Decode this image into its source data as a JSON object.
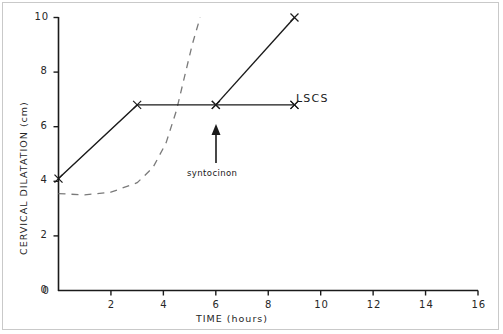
{
  "figure": {
    "background": "#ffffff",
    "border_color": "#c9c9c9"
  },
  "chart_data": {
    "type": "line",
    "title": "",
    "xlabel": "TIME  (hours)",
    "ylabel": "CERVICAL DILATATION (cm)",
    "xlim": [
      0,
      16
    ],
    "ylim": [
      0,
      10
    ],
    "xticks": [
      0,
      2,
      4,
      6,
      8,
      10,
      12,
      14,
      16
    ],
    "xticklabels": [
      "0",
      "2",
      "4",
      "6",
      "8",
      "10",
      "12",
      "14",
      "16"
    ],
    "yticks": [
      0,
      2,
      4,
      6,
      8,
      10
    ],
    "yticklabels": [
      "0",
      "2",
      "4",
      "6",
      "8",
      "10"
    ],
    "grid": false,
    "legend_position": "none",
    "series": [
      {
        "name": "observed labour progress",
        "style": "solid",
        "color": "#1a1a1a",
        "marker": "x",
        "x": [
          0,
          3,
          6,
          9
        ],
        "y": [
          4.1,
          6.8,
          6.8,
          6.8
        ]
      },
      {
        "name": "caesarean section progress",
        "style": "solid",
        "color": "#1a1a1a",
        "marker": "x",
        "x": [
          6,
          9
        ],
        "y": [
          6.8,
          10.0
        ]
      },
      {
        "name": "expected normal progress (alert curve)",
        "style": "dashed",
        "color": "#6e6e6e",
        "marker": "none",
        "x": [
          0,
          1,
          2,
          3,
          3.6,
          4.1,
          4.5,
          4.8,
          5.1,
          5.4
        ],
        "y": [
          3.55,
          3.5,
          3.6,
          3.95,
          4.5,
          5.4,
          6.6,
          7.8,
          9.0,
          10.0
        ]
      }
    ],
    "annotations": [
      {
        "name": "syntocinon",
        "text": "syntocinon",
        "x": 6,
        "y": 4.2,
        "arrow": "up",
        "arrow_tip_y": 6.4
      },
      {
        "name": "LSCS",
        "text": "LSCS",
        "x": 9.2,
        "y": 6.8,
        "arrow": "none"
      }
    ]
  }
}
